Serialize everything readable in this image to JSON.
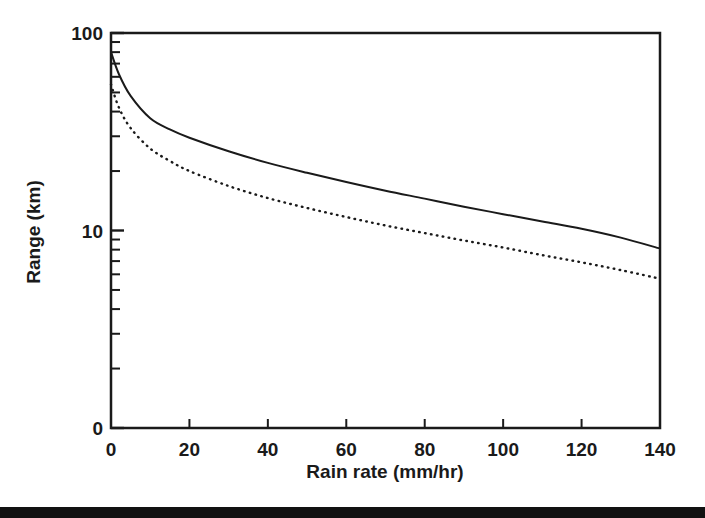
{
  "figure": {
    "background_color": "#ffffff",
    "ink_color": "#1a1a1a",
    "bottom_bar_color": "#111111"
  },
  "chart_data": {
    "type": "line",
    "title": "",
    "xlabel": "Rain rate (mm/hr)",
    "ylabel": "Range (km)",
    "xlim": [
      0,
      140
    ],
    "ylim": [
      1,
      100
    ],
    "yscale": "log",
    "xscale": "linear",
    "grid": false,
    "legend": "none",
    "xticks": [
      0,
      20,
      40,
      60,
      80,
      100,
      120,
      140
    ],
    "xticklabels": [
      "0",
      "20",
      "40",
      "60",
      "80",
      "100",
      "120",
      "140"
    ],
    "yticks": [
      100,
      10,
      1
    ],
    "yticklabels": [
      "100",
      "10",
      "0"
    ],
    "y_minor_ticks": [
      90,
      80,
      70,
      60,
      50,
      40,
      30,
      20,
      9,
      8,
      7,
      6,
      5,
      4,
      3,
      2
    ],
    "x": [
      0,
      2,
      5,
      10,
      15,
      20,
      30,
      40,
      50,
      60,
      70,
      80,
      90,
      100,
      110,
      120,
      130,
      140
    ],
    "series": [
      {
        "name": "solid-curve",
        "style": "solid",
        "color": "#1a1a1a",
        "values": [
          80.0,
          62.0,
          48.0,
          37.0,
          32.5,
          29.5,
          25.2,
          22.0,
          19.6,
          17.6,
          15.9,
          14.5,
          13.2,
          12.1,
          11.1,
          10.2,
          9.2,
          8.1
        ]
      },
      {
        "name": "dotted-curve",
        "style": "dotted",
        "color": "#1a1a1a",
        "values": [
          55.0,
          42.0,
          33.0,
          26.0,
          22.5,
          20.0,
          16.8,
          14.6,
          13.0,
          11.7,
          10.6,
          9.7,
          8.9,
          8.2,
          7.5,
          6.9,
          6.3,
          5.7
        ]
      }
    ]
  },
  "axis_labels": {
    "x_title": "Rain rate (mm/hr)",
    "y_title": "Range (km)"
  }
}
